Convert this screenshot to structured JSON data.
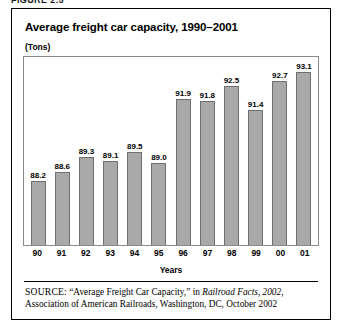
{
  "figure": {
    "caption_cutoff": "FIGURE 2.5"
  },
  "chart": {
    "title": "Average freight car capacity, 1990–2001",
    "unit_label": "(Tons)",
    "xaxis_title": "Years"
  },
  "source": {
    "label": "SOURCE:",
    "text_before_italic": " “Average Freight Car Capacity,” in ",
    "italic_title": "Railroad Facts, 2002,",
    "text_after_italic": " Association of American Railroads, Washington, DC, October 2002"
  },
  "chart_data": {
    "type": "bar",
    "title": "Average freight car capacity, 1990–2001",
    "subtitle": "(Tons)",
    "xlabel": "Years",
    "ylabel": "(Tons)",
    "grid": false,
    "legend": "none",
    "ylim": [
      85.3,
      93.8
    ],
    "categories": [
      "90",
      "91",
      "92",
      "93",
      "94",
      "95",
      "96",
      "97",
      "98",
      "99",
      "00",
      "01"
    ],
    "category_full_years": [
      "1990",
      "1991",
      "1992",
      "1993",
      "1994",
      "1995",
      "1996",
      "1997",
      "1998",
      "1999",
      "2000",
      "2001"
    ],
    "values": [
      88.2,
      88.6,
      89.3,
      89.1,
      89.5,
      89.0,
      91.9,
      91.8,
      92.5,
      91.4,
      92.7,
      93.1
    ],
    "value_labels": [
      "88.2",
      "88.6",
      "89.3",
      "89.1",
      "89.5",
      "89.0",
      "91.9",
      "91.8",
      "92.5",
      "91.4",
      "92.7",
      "93.1"
    ],
    "colors": {
      "bar_fill": "#a9a9a9",
      "bar_stroke": "#6f6f6f",
      "frame": "#8a8a8a",
      "text": "#000000",
      "panel_border": "#000000",
      "background": "#ffffff"
    }
  }
}
